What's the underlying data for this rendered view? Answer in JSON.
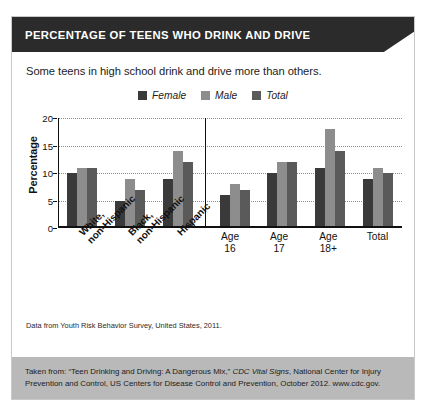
{
  "header": {
    "title": "PERCENTAGE OF TEENS WHO DRINK AND DRIVE"
  },
  "subtitle": "Some teens in high school drink and drive more than others.",
  "source_line": "Data from Youth Risk Behavior Survey, United States, 2011.",
  "footer": {
    "part1": "Taken from: “Teen Drinking and Driving: A Dangerous Mix,” ",
    "italic": "CDC Vital Signs",
    "part2": ", National Center for Injury Prevention and Control, US Centers for Disease Control and Prevention, October 2012. www.cdc.gov."
  },
  "colors": {
    "banner_bg": "#2b2b2b",
    "female": "#3a3a3a",
    "male": "#8d8d8d",
    "total": "#5a5a5a",
    "footer_bg": "#b9b9b9",
    "grid": "#8e8e8e",
    "axis": "#111111"
  },
  "chart_data": {
    "type": "bar",
    "title": "PERCENTAGE OF TEENS WHO DRINK AND DRIVE",
    "subtitle": "Some teens in high school drink and drive more than others.",
    "xlabel": "",
    "ylabel": "Percentage",
    "ylim": [
      0,
      20
    ],
    "yticks": [
      0,
      5,
      10,
      15,
      20
    ],
    "grid": true,
    "legend_position": "top-center",
    "categories": [
      "White, non-Hispanic",
      "Black, non-Hispanic",
      "Hispanic",
      "Age 16",
      "Age 17",
      "Age 18+",
      "Total"
    ],
    "category_lines": [
      [
        "White,",
        "non-Hispanic"
      ],
      [
        "Black,",
        "non-Hispanic"
      ],
      [
        "Hispanic"
      ],
      [
        "Age",
        "16"
      ],
      [
        "Age",
        "17"
      ],
      [
        "Age",
        "18+"
      ],
      [
        "Total"
      ]
    ],
    "series": [
      {
        "name": "Female",
        "color": "#3a3a3a",
        "values": [
          10,
          5,
          9,
          6,
          10,
          11,
          9
        ]
      },
      {
        "name": "Male",
        "color": "#8d8d8d",
        "values": [
          11,
          9,
          14,
          8,
          12,
          18,
          11
        ]
      },
      {
        "name": "Total",
        "color": "#5a5a5a",
        "values": [
          11,
          7,
          12,
          7,
          12,
          14,
          10
        ]
      }
    ]
  }
}
